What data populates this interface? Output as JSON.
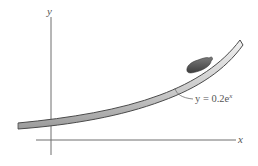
{
  "diagram": {
    "axes": {
      "x_label": "x",
      "y_label": "y"
    },
    "curve": {
      "equation_prefix": "y = 0.2e",
      "equation_exponent": "x"
    },
    "colors": {
      "axis": "#6e6e6e",
      "band_edge": "#4a4a4a",
      "band_fill_light": "#e4e4e4",
      "band_fill_dark": "#a8a8a8",
      "object": "#5a5a5a",
      "label": "#555555"
    }
  }
}
